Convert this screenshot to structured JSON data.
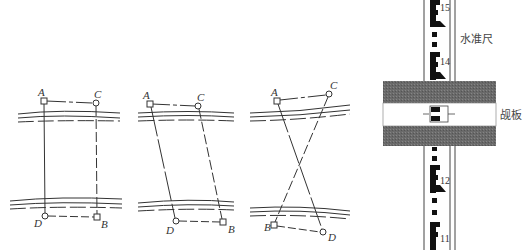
{
  "figures": [
    {
      "id": "fig-parallel-rectangle",
      "points": {
        "A": {
          "label": "A",
          "x": 44,
          "y": 101,
          "marker": "square"
        },
        "C": {
          "label": "C",
          "x": 96,
          "y": 103,
          "marker": "circle"
        },
        "D": {
          "label": "D",
          "x": 45,
          "y": 216,
          "marker": "circle"
        },
        "B": {
          "label": "B",
          "x": 97,
          "y": 217,
          "marker": "square"
        }
      }
    },
    {
      "id": "fig-parallelogram",
      "points": {
        "A": {
          "label": "A",
          "x": 150,
          "y": 104,
          "marker": "square"
        },
        "C": {
          "label": "C",
          "x": 198,
          "y": 106,
          "marker": "circle"
        },
        "D": {
          "label": "D",
          "x": 176,
          "y": 221,
          "marker": "circle"
        },
        "B": {
          "label": "B",
          "x": 223,
          "y": 222,
          "marker": "square"
        }
      }
    },
    {
      "id": "fig-crossed",
      "points": {
        "A": {
          "label": "A",
          "x": 277,
          "y": 101,
          "marker": "square"
        },
        "C": {
          "label": "C",
          "x": 329,
          "y": 94,
          "marker": "circle"
        },
        "B": {
          "label": "B",
          "x": 274,
          "y": 225,
          "marker": "square"
        },
        "D": {
          "label": "D",
          "x": 323,
          "y": 232,
          "marker": "circle"
        }
      }
    }
  ],
  "rod": {
    "label": "水准尺",
    "graduations": [
      "15",
      "14",
      "12",
      "11"
    ]
  },
  "vane": {
    "label": "觇板"
  }
}
